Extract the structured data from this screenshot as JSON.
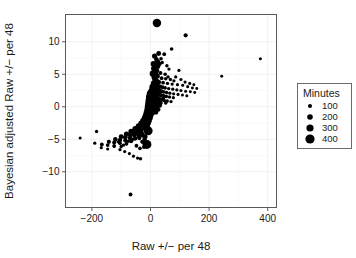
{
  "chart_data": {
    "type": "scatter",
    "title": "",
    "xlabel": "Raw +/− per 48",
    "ylabel": "Bayesian adjusted Raw +/− per 48",
    "xlim": [
      -290,
      430
    ],
    "ylim": [
      -15.5,
      14.2
    ],
    "xticks": [
      -200,
      0,
      200,
      400
    ],
    "xtick_labels": [
      "−200",
      "0",
      "200",
      "400"
    ],
    "yticks": [
      -10,
      -5,
      0,
      5,
      10
    ],
    "ytick_labels": [
      "−10",
      "−5",
      "0",
      "5",
      "10"
    ],
    "grid": true,
    "grid_color": "#ededed",
    "point_color": "#000000",
    "size_field": "Minutes",
    "legend": {
      "title": "Minutes",
      "position": "right",
      "entries": [
        {
          "label": "100",
          "value": 100,
          "radius": 2.0
        },
        {
          "label": "200",
          "value": 200,
          "radius": 2.8
        },
        {
          "label": "300",
          "value": 300,
          "radius": 3.6
        },
        {
          "label": "400",
          "value": 400,
          "radius": 4.6
        }
      ]
    },
    "points": [
      {
        "x": 22,
        "y": 12.9,
        "minutes": 380
      },
      {
        "x": 120,
        "y": 11.0,
        "minutes": 150
      },
      {
        "x": 28,
        "y": 8.2,
        "minutes": 190
      },
      {
        "x": 47,
        "y": 8.1,
        "minutes": 130
      },
      {
        "x": 72,
        "y": 8.9,
        "minutes": 120
      },
      {
        "x": 375,
        "y": 7.4,
        "minutes": 90
      },
      {
        "x": 20,
        "y": 7.3,
        "minutes": 170
      },
      {
        "x": 24,
        "y": 6.9,
        "minutes": 210
      },
      {
        "x": 31,
        "y": 6.6,
        "minutes": 150
      },
      {
        "x": 18,
        "y": 6.4,
        "minutes": 230
      },
      {
        "x": 26,
        "y": 6.2,
        "minutes": 160
      },
      {
        "x": 56,
        "y": 6.3,
        "minutes": 110
      },
      {
        "x": 63,
        "y": 5.8,
        "minutes": 100
      },
      {
        "x": 21,
        "y": 5.6,
        "minutes": 200
      },
      {
        "x": 16,
        "y": 5.4,
        "minutes": 240
      },
      {
        "x": 34,
        "y": 5.2,
        "minutes": 140
      },
      {
        "x": 97,
        "y": 5.6,
        "minutes": 95
      },
      {
        "x": 243,
        "y": 4.7,
        "minutes": 85
      },
      {
        "x": 19,
        "y": 4.9,
        "minutes": 220
      },
      {
        "x": 24,
        "y": 4.7,
        "minutes": 180
      },
      {
        "x": 14,
        "y": 4.5,
        "minutes": 250
      },
      {
        "x": 38,
        "y": 4.4,
        "minutes": 130
      },
      {
        "x": 52,
        "y": 4.3,
        "minutes": 115
      },
      {
        "x": 68,
        "y": 4.2,
        "minutes": 105
      },
      {
        "x": 80,
        "y": 4.0,
        "minutes": 100
      },
      {
        "x": 17,
        "y": 4.1,
        "minutes": 230
      },
      {
        "x": 22,
        "y": 3.9,
        "minutes": 210
      },
      {
        "x": 29,
        "y": 3.8,
        "minutes": 160
      },
      {
        "x": 43,
        "y": 3.7,
        "minutes": 125
      },
      {
        "x": 58,
        "y": 3.6,
        "minutes": 110
      },
      {
        "x": 74,
        "y": 3.5,
        "minutes": 100
      },
      {
        "x": 92,
        "y": 3.4,
        "minutes": 95
      },
      {
        "x": 110,
        "y": 3.3,
        "minutes": 90
      },
      {
        "x": 127,
        "y": 3.1,
        "minutes": 88
      },
      {
        "x": 143,
        "y": 2.9,
        "minutes": 85
      },
      {
        "x": 12,
        "y": 3.6,
        "minutes": 260
      },
      {
        "x": 16,
        "y": 3.4,
        "minutes": 240
      },
      {
        "x": 20,
        "y": 3.3,
        "minutes": 215
      },
      {
        "x": 25,
        "y": 3.2,
        "minutes": 185
      },
      {
        "x": 33,
        "y": 3.1,
        "minutes": 150
      },
      {
        "x": 41,
        "y": 3.0,
        "minutes": 135
      },
      {
        "x": 50,
        "y": 2.9,
        "minutes": 120
      },
      {
        "x": 62,
        "y": 2.8,
        "minutes": 108
      },
      {
        "x": 76,
        "y": 2.7,
        "minutes": 100
      },
      {
        "x": 90,
        "y": 2.6,
        "minutes": 96
      },
      {
        "x": 104,
        "y": 2.5,
        "minutes": 92
      },
      {
        "x": 120,
        "y": 2.4,
        "minutes": 88
      },
      {
        "x": 136,
        "y": 2.3,
        "minutes": 86
      },
      {
        "x": 151,
        "y": 2.2,
        "minutes": 84
      },
      {
        "x": 8,
        "y": 3.0,
        "minutes": 300
      },
      {
        "x": 11,
        "y": 2.9,
        "minutes": 275
      },
      {
        "x": 15,
        "y": 2.8,
        "minutes": 250
      },
      {
        "x": 19,
        "y": 2.7,
        "minutes": 220
      },
      {
        "x": 24,
        "y": 2.6,
        "minutes": 195
      },
      {
        "x": 30,
        "y": 2.5,
        "minutes": 165
      },
      {
        "x": 37,
        "y": 2.4,
        "minutes": 145
      },
      {
        "x": 45,
        "y": 2.3,
        "minutes": 128
      },
      {
        "x": 55,
        "y": 2.2,
        "minutes": 115
      },
      {
        "x": 66,
        "y": 2.1,
        "minutes": 105
      },
      {
        "x": 79,
        "y": 2.0,
        "minutes": 98
      },
      {
        "x": 94,
        "y": 1.9,
        "minutes": 94
      },
      {
        "x": 109,
        "y": 1.8,
        "minutes": 90
      },
      {
        "x": 124,
        "y": 1.7,
        "minutes": 87
      },
      {
        "x": 6,
        "y": 2.4,
        "minutes": 330
      },
      {
        "x": 9,
        "y": 2.3,
        "minutes": 300
      },
      {
        "x": 13,
        "y": 2.2,
        "minutes": 265
      },
      {
        "x": 17,
        "y": 2.1,
        "minutes": 235
      },
      {
        "x": 22,
        "y": 2.0,
        "minutes": 205
      },
      {
        "x": 28,
        "y": 1.9,
        "minutes": 175
      },
      {
        "x": 35,
        "y": 1.8,
        "minutes": 150
      },
      {
        "x": 44,
        "y": 1.7,
        "minutes": 130
      },
      {
        "x": 54,
        "y": 1.6,
        "minutes": 118
      },
      {
        "x": 65,
        "y": 1.5,
        "minutes": 107
      },
      {
        "x": 78,
        "y": 1.4,
        "minutes": 99
      },
      {
        "x": 2,
        "y": 2.0,
        "minutes": 400
      },
      {
        "x": 4,
        "y": 1.8,
        "minutes": 360
      },
      {
        "x": 7,
        "y": 1.7,
        "minutes": 320
      },
      {
        "x": 10,
        "y": 1.6,
        "minutes": 290
      },
      {
        "x": 14,
        "y": 1.5,
        "minutes": 255
      },
      {
        "x": 18,
        "y": 1.4,
        "minutes": 225
      },
      {
        "x": 23,
        "y": 1.3,
        "minutes": 198
      },
      {
        "x": 29,
        "y": 1.2,
        "minutes": 170
      },
      {
        "x": 36,
        "y": 1.1,
        "minutes": 148
      },
      {
        "x": 46,
        "y": 1.0,
        "minutes": 126
      },
      {
        "x": 57,
        "y": 0.9,
        "minutes": 113
      },
      {
        "x": 70,
        "y": 0.8,
        "minutes": 103
      },
      {
        "x": 0,
        "y": 1.5,
        "minutes": 420
      },
      {
        "x": 3,
        "y": 1.3,
        "minutes": 370
      },
      {
        "x": 6,
        "y": 1.2,
        "minutes": 330
      },
      {
        "x": 9,
        "y": 1.1,
        "minutes": 295
      },
      {
        "x": 13,
        "y": 1.0,
        "minutes": 260
      },
      {
        "x": 17,
        "y": 0.9,
        "minutes": 228
      },
      {
        "x": 22,
        "y": 0.8,
        "minutes": 200
      },
      {
        "x": 28,
        "y": 0.7,
        "minutes": 172
      },
      {
        "x": 35,
        "y": 0.6,
        "minutes": 150
      },
      {
        "x": -2,
        "y": 1.0,
        "minutes": 390
      },
      {
        "x": 1,
        "y": 0.9,
        "minutes": 350
      },
      {
        "x": 4,
        "y": 0.8,
        "minutes": 315
      },
      {
        "x": 8,
        "y": 0.7,
        "minutes": 280
      },
      {
        "x": 12,
        "y": 0.6,
        "minutes": 250
      },
      {
        "x": 16,
        "y": 0.5,
        "minutes": 220
      },
      {
        "x": 21,
        "y": 0.4,
        "minutes": 192
      },
      {
        "x": 27,
        "y": 0.3,
        "minutes": 166
      },
      {
        "x": -4,
        "y": 0.5,
        "minutes": 370
      },
      {
        "x": -1,
        "y": 0.4,
        "minutes": 340
      },
      {
        "x": 2,
        "y": 0.3,
        "minutes": 305
      },
      {
        "x": 6,
        "y": 0.2,
        "minutes": 272
      },
      {
        "x": 10,
        "y": 0.1,
        "minutes": 242
      },
      {
        "x": 15,
        "y": 0.0,
        "minutes": 214
      },
      {
        "x": 20,
        "y": -0.1,
        "minutes": 188
      },
      {
        "x": -6,
        "y": 0.0,
        "minutes": 355
      },
      {
        "x": -3,
        "y": -0.1,
        "minutes": 325
      },
      {
        "x": 0,
        "y": -0.2,
        "minutes": 295
      },
      {
        "x": 4,
        "y": -0.3,
        "minutes": 265
      },
      {
        "x": 8,
        "y": -0.4,
        "minutes": 0
      },
      {
        "x": 13,
        "y": -0.5,
        "minutes": 208
      },
      {
        "x": -8,
        "y": -0.5,
        "minutes": 340
      },
      {
        "x": -5,
        "y": -0.6,
        "minutes": 312
      },
      {
        "x": -2,
        "y": -0.7,
        "minutes": 285
      },
      {
        "x": 2,
        "y": -0.8,
        "minutes": 258
      },
      {
        "x": 6,
        "y": -0.9,
        "minutes": 232
      },
      {
        "x": -11,
        "y": -1.0,
        "minutes": 325
      },
      {
        "x": -7,
        "y": -1.1,
        "minutes": 300
      },
      {
        "x": -4,
        "y": -1.2,
        "minutes": 275
      },
      {
        "x": 0,
        "y": -1.3,
        "minutes": 250
      },
      {
        "x": -14,
        "y": -1.4,
        "minutes": 315
      },
      {
        "x": -10,
        "y": -1.5,
        "minutes": 290
      },
      {
        "x": -6,
        "y": -1.6,
        "minutes": 266
      },
      {
        "x": -2,
        "y": -1.7,
        "minutes": 242
      },
      {
        "x": -18,
        "y": -1.8,
        "minutes": 300
      },
      {
        "x": -14,
        "y": -1.9,
        "minutes": 278
      },
      {
        "x": -9,
        "y": -2.0,
        "minutes": 255
      },
      {
        "x": -5,
        "y": -2.1,
        "minutes": 234
      },
      {
        "x": -24,
        "y": -2.2,
        "minutes": 285
      },
      {
        "x": -19,
        "y": -2.3,
        "minutes": 264
      },
      {
        "x": -13,
        "y": -2.4,
        "minutes": 244
      },
      {
        "x": -8,
        "y": -2.5,
        "minutes": 226
      },
      {
        "x": -31,
        "y": -2.6,
        "minutes": 270
      },
      {
        "x": -25,
        "y": -2.7,
        "minutes": 250
      },
      {
        "x": -18,
        "y": -2.8,
        "minutes": 232
      },
      {
        "x": -11,
        "y": -2.9,
        "minutes": 216
      },
      {
        "x": -40,
        "y": -3.0,
        "minutes": 254
      },
      {
        "x": -33,
        "y": -3.1,
        "minutes": 236
      },
      {
        "x": -25,
        "y": -3.2,
        "minutes": 220
      },
      {
        "x": -16,
        "y": -3.3,
        "minutes": 205
      },
      {
        "x": -52,
        "y": -3.4,
        "minutes": 238
      },
      {
        "x": -43,
        "y": -3.5,
        "minutes": 222
      },
      {
        "x": -33,
        "y": -3.6,
        "minutes": 208
      },
      {
        "x": -8,
        "y": -3.7,
        "minutes": 410
      },
      {
        "x": -66,
        "y": -3.8,
        "minutes": 222
      },
      {
        "x": -55,
        "y": -3.9,
        "minutes": 208
      },
      {
        "x": -43,
        "y": -4.0,
        "minutes": 195
      },
      {
        "x": -30,
        "y": -4.1,
        "minutes": 185
      },
      {
        "x": -82,
        "y": -4.2,
        "minutes": 205
      },
      {
        "x": -69,
        "y": -4.3,
        "minutes": 192
      },
      {
        "x": -55,
        "y": -4.4,
        "minutes": 180
      },
      {
        "x": -40,
        "y": -4.5,
        "minutes": 172
      },
      {
        "x": -100,
        "y": -4.6,
        "minutes": 188
      },
      {
        "x": -86,
        "y": -4.7,
        "minutes": 176
      },
      {
        "x": -70,
        "y": -4.8,
        "minutes": 166
      },
      {
        "x": -52,
        "y": -4.9,
        "minutes": 158
      },
      {
        "x": -120,
        "y": -5.0,
        "minutes": 170
      },
      {
        "x": -104,
        "y": -5.1,
        "minutes": 160
      },
      {
        "x": -86,
        "y": -5.2,
        "minutes": 150
      },
      {
        "x": -66,
        "y": -5.3,
        "minutes": 143
      },
      {
        "x": -142,
        "y": -5.4,
        "minutes": 152
      },
      {
        "x": -124,
        "y": -5.5,
        "minutes": 143
      },
      {
        "x": -104,
        "y": -5.6,
        "minutes": 135
      },
      {
        "x": -82,
        "y": -5.7,
        "minutes": 128
      },
      {
        "x": -12,
        "y": -5.8,
        "minutes": 400
      },
      {
        "x": -166,
        "y": -5.8,
        "minutes": 134
      },
      {
        "x": -146,
        "y": -5.9,
        "minutes": 126
      },
      {
        "x": -124,
        "y": -6.0,
        "minutes": 119
      },
      {
        "x": -100,
        "y": -6.1,
        "minutes": 113
      },
      {
        "x": -184,
        "y": -3.8,
        "minutes": 105
      },
      {
        "x": -190,
        "y": -5.6,
        "minutes": 100
      },
      {
        "x": -240,
        "y": -4.8,
        "minutes": 92
      },
      {
        "x": -168,
        "y": -6.3,
        "minutes": 98
      },
      {
        "x": -146,
        "y": -6.5,
        "minutes": 95
      },
      {
        "x": -124,
        "y": -6.1,
        "minutes": 102
      },
      {
        "x": -104,
        "y": -6.6,
        "minutes": 98
      },
      {
        "x": -88,
        "y": -6.9,
        "minutes": 96
      },
      {
        "x": -72,
        "y": -7.2,
        "minutes": 94
      },
      {
        "x": -58,
        "y": -7.6,
        "minutes": 92
      },
      {
        "x": -44,
        "y": -7.9,
        "minutes": 104
      },
      {
        "x": -34,
        "y": -8.0,
        "minutes": 108
      },
      {
        "x": -60,
        "y": -5.0,
        "minutes": 120
      },
      {
        "x": -76,
        "y": -5.3,
        "minutes": 112
      },
      {
        "x": -92,
        "y": -5.9,
        "minutes": 106
      },
      {
        "x": -110,
        "y": -5.4,
        "minutes": 110
      },
      {
        "x": -36,
        "y": -6.4,
        "minutes": 124
      },
      {
        "x": -48,
        "y": -6.0,
        "minutes": 130
      },
      {
        "x": -22,
        "y": -6.2,
        "minutes": 145
      },
      {
        "x": -28,
        "y": -5.4,
        "minutes": 150
      },
      {
        "x": -18,
        "y": -4.6,
        "minutes": 185
      },
      {
        "x": -26,
        "y": -4.4,
        "minutes": 172
      },
      {
        "x": -38,
        "y": -4.8,
        "minutes": 158
      },
      {
        "x": -20,
        "y": -5.0,
        "minutes": 164
      },
      {
        "x": -68,
        "y": -13.5,
        "minutes": 135
      },
      {
        "x": 40,
        "y": 6.8,
        "minutes": 112
      },
      {
        "x": 36,
        "y": 7.4,
        "minutes": 118
      },
      {
        "x": 14,
        "y": 7.8,
        "minutes": 205
      },
      {
        "x": 10,
        "y": 6.6,
        "minutes": 225
      },
      {
        "x": 12,
        "y": 5.9,
        "minutes": 240
      },
      {
        "x": 8,
        "y": 5.1,
        "minutes": 265
      },
      {
        "x": 50,
        "y": 5.0,
        "minutes": 120
      },
      {
        "x": 60,
        "y": 4.6,
        "minutes": 112
      },
      {
        "x": 86,
        "y": 4.6,
        "minutes": 100
      },
      {
        "x": 104,
        "y": 4.2,
        "minutes": 95
      },
      {
        "x": 118,
        "y": 3.8,
        "minutes": 92
      },
      {
        "x": 134,
        "y": 3.6,
        "minutes": 88
      },
      {
        "x": 148,
        "y": 3.4,
        "minutes": 86
      },
      {
        "x": 158,
        "y": 2.8,
        "minutes": 84
      },
      {
        "x": 44,
        "y": 1.4,
        "minutes": 132
      },
      {
        "x": 52,
        "y": 0.6,
        "minutes": 122
      },
      {
        "x": 32,
        "y": 0.2,
        "minutes": 160
      },
      {
        "x": 26,
        "y": -0.4,
        "minutes": 180
      },
      {
        "x": 18,
        "y": -0.8,
        "minutes": 200
      }
    ]
  }
}
